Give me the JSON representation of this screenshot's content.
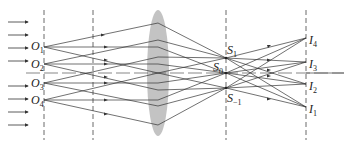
{
  "diagram": {
    "colors": {
      "line": "#333333",
      "lens": "#b0b0b0",
      "dash": "#444444"
    },
    "object_labels": [
      {
        "base": "O",
        "sub": "1"
      },
      {
        "base": "O",
        "sub": "2"
      },
      {
        "base": "O",
        "sub": "3"
      },
      {
        "base": "O",
        "sub": "4"
      }
    ],
    "spectrum_labels": [
      {
        "base": "S",
        "sub": "1"
      },
      {
        "base": "S",
        "sub": "0"
      },
      {
        "base": "S",
        "sub": "−1"
      }
    ],
    "image_labels": [
      {
        "base": "I",
        "sub": "4"
      },
      {
        "base": "I",
        "sub": "3"
      },
      {
        "base": "I",
        "sub": "2"
      },
      {
        "base": "I",
        "sub": "1"
      }
    ]
  }
}
